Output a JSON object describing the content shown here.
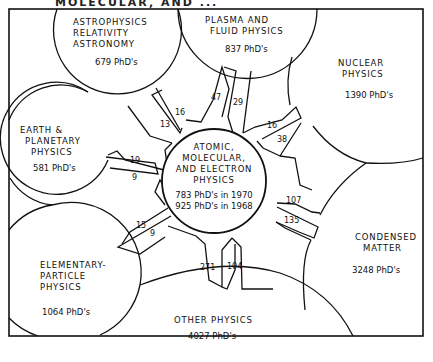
{
  "title_fragment": "MOLECULAR, AND ...",
  "center": {
    "lines": [
      "ATOMIC,",
      "MOLECULAR,",
      "AND ELECTRON",
      "PHYSICS"
    ],
    "stat_1970": "783 PhD's in 1970",
    "stat_1968": "925 PhD's in 1968"
  },
  "fields": {
    "astro": {
      "lines": [
        "ASTROPHYSICS",
        "RELATIVITY",
        "ASTRONOMY"
      ],
      "phds": "679 PhD's"
    },
    "plasma": {
      "lines": [
        "PLASMA AND",
        "FLUID PHYSICS"
      ],
      "phds": "837 PhD's"
    },
    "nuclear": {
      "lines": [
        "NUCLEAR",
        "PHYSICS"
      ],
      "phds": "1390 PhD's"
    },
    "earth": {
      "lines": [
        "EARTH &",
        "PLANETARY",
        "PHYSICS"
      ],
      "phds": "581 PhD's"
    },
    "condensed": {
      "lines": [
        "CONDENSED",
        "MATTER"
      ],
      "phds": "3248 PhD's"
    },
    "elementary": {
      "lines": [
        "ELEMENTARY-",
        "PARTICLE",
        "PHYSICS"
      ],
      "phds": "1064 PhD's"
    },
    "other": {
      "lines": [
        "OTHER PHYSICS"
      ],
      "phds": "4027 PhD's"
    }
  },
  "flows": {
    "astro_in": "13",
    "astro_out": "16",
    "plasma_in": "47",
    "plasma_out": "29",
    "nuclear_in": "16",
    "nuclear_out": "38",
    "earth_in": "19",
    "earth_out": "9",
    "condensed_in": "107",
    "condensed_out": "135",
    "elementary_in": "15",
    "elementary_out": "9",
    "other_in": "271",
    "other_out": "104"
  }
}
